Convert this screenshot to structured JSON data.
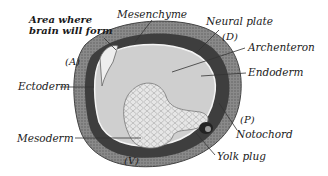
{
  "figure": {
    "type": "anatomical-illustration",
    "labels": {
      "brain_area_line1": "Area where",
      "brain_area_line2": "brain will form",
      "mesenchyme": "Mesenchyme",
      "neural_plate": "Neural plate",
      "dorsal": "(D)",
      "archenteron": "Archenteron",
      "endoderm": "Endoderm",
      "anterior": "(A)",
      "ectoderm": "Ectoderm",
      "posterior": "(P)",
      "notochord": "Notochord",
      "mesoderm": "Mesoderm",
      "ventral": "(V)",
      "yolk_plug": "Yolk plug"
    },
    "colors": {
      "outer_ectoderm": "#6e6e6e",
      "mesoderm_dark": "#3a3a3a",
      "archenteron_fill": "#c9c9c9",
      "yolk_cells": "#e4e4e4",
      "line": "#333333"
    }
  }
}
